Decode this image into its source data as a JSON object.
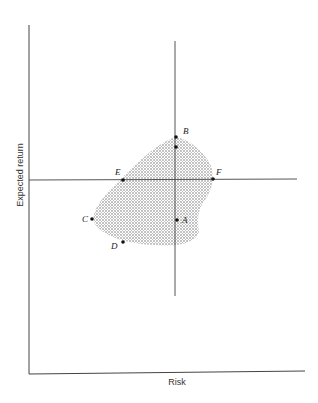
{
  "axes": {
    "x_label": "Risk",
    "y_label": "Expected return"
  },
  "points": [
    {
      "id": "B",
      "label": "B",
      "x": 176,
      "y": 137,
      "lx": 183,
      "ly": 134
    },
    {
      "id": "B2",
      "label": "",
      "x": 176,
      "y": 147,
      "lx": 0,
      "ly": 0
    },
    {
      "id": "E",
      "label": "E",
      "x": 123,
      "y": 180,
      "lx": 115,
      "ly": 175
    },
    {
      "id": "F",
      "label": "F",
      "x": 213,
      "y": 179,
      "lx": 216,
      "ly": 175
    },
    {
      "id": "C",
      "label": "C",
      "x": 92,
      "y": 219,
      "lx": 82,
      "ly": 222
    },
    {
      "id": "A",
      "label": "A",
      "x": 177,
      "y": 220,
      "lx": 182,
      "ly": 223
    },
    {
      "id": "D",
      "label": "D",
      "x": 123,
      "y": 242,
      "lx": 111,
      "ly": 249
    }
  ],
  "colors": {
    "ink": "#333333",
    "dots": "#888888"
  }
}
